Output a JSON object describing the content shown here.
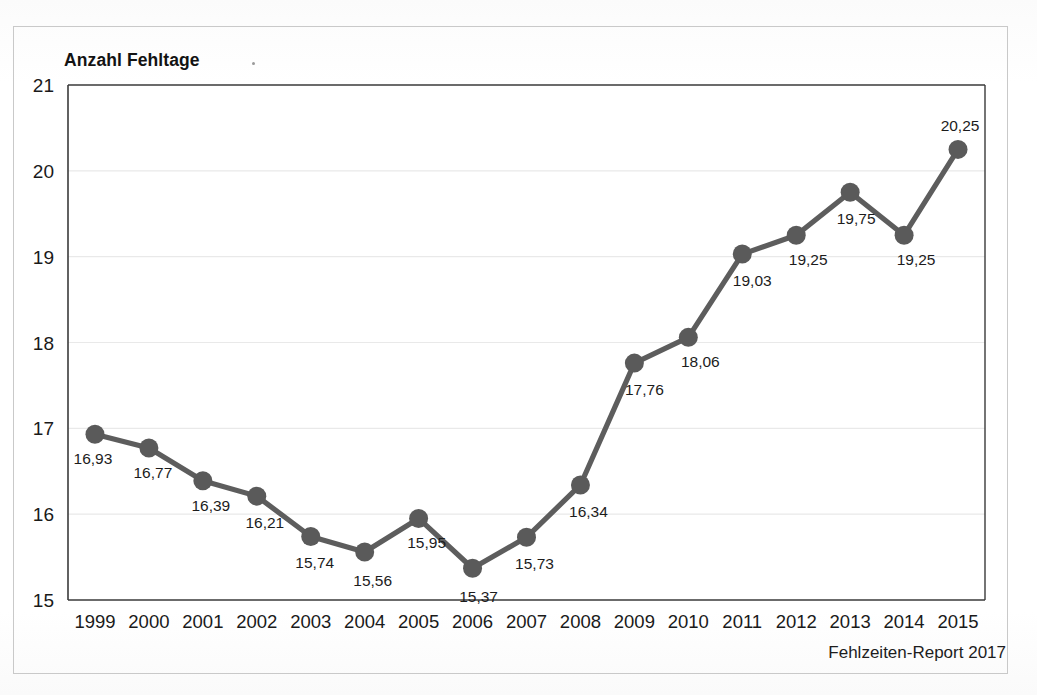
{
  "figure": {
    "title": "Anzahl Fehltage",
    "footer": "Fehlzeiten-Report 2017",
    "colors": {
      "line": "#5d5d5d",
      "marker": "#5a5a5a",
      "axis": "#3a3a3a",
      "grid": "#e9e9e9",
      "text": "#1a1a1a",
      "frame": "#c9c9c9",
      "background": "#ffffff"
    }
  },
  "chart_data": {
    "type": "line",
    "title": "Anzahl Fehltage",
    "xlabel": "",
    "ylabel": "Anzahl Fehltage",
    "ylim": [
      15,
      21
    ],
    "yticks": [
      "15",
      "16",
      "17",
      "18",
      "19",
      "20",
      "21"
    ],
    "grid": true,
    "legend": false,
    "annotation": "Fehlzeiten-Report 2017",
    "categories": [
      "1999",
      "2000",
      "2001",
      "2002",
      "2003",
      "2004",
      "2005",
      "2006",
      "2007",
      "2008",
      "2009",
      "2010",
      "2011",
      "2012",
      "2013",
      "2014",
      "2015"
    ],
    "values": [
      16.93,
      16.77,
      16.39,
      16.21,
      15.74,
      15.56,
      15.95,
      15.37,
      15.73,
      16.34,
      17.76,
      18.06,
      19.03,
      19.25,
      19.75,
      19.25,
      20.25
    ],
    "value_labels": [
      "16,93",
      "16,77",
      "16,39",
      "16,21",
      "15,74",
      "15,56",
      "15,95",
      "15,37",
      "15,73",
      "16,34",
      "17,76",
      "18,06",
      "19,03",
      "19,25",
      "19,75",
      "19,25",
      "20,25"
    ]
  }
}
